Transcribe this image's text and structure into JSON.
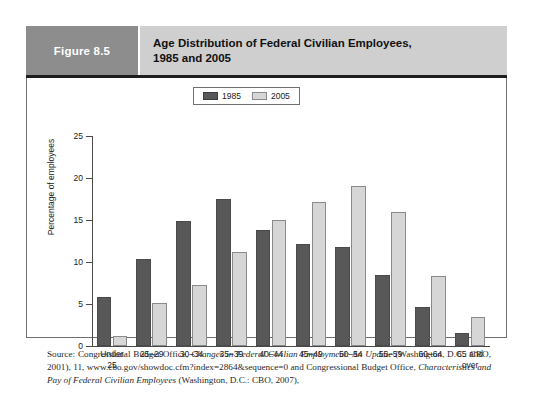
{
  "figure": {
    "number_label": "Figure 8.5",
    "title_line1": "Age Distribution of Federal Civilian Employees,",
    "title_line2": "1985 and 2005"
  },
  "colors": {
    "series_1985": "#585858",
    "series_2005": "#d6d6d6",
    "header_band": "#cfcfcf",
    "figure_number_block": "#8d8d8d",
    "axis": "#4a4a4a"
  },
  "source": {
    "prefix": "Source: Congressional Budget Office, ",
    "title_1": "Changes in Federal Civilian Employment: An Update",
    "middle": " (Washington, D.C.: CBO, 2001), 11, www.cbo.gov/showdoc.cfm?index=2864&sequence=0 and Congressional Budget Office, ",
    "title_2": "Characteristics and Pay of Federal Civilian Employees",
    "suffix": " (Washington, D.C.: CBO, 2007),"
  },
  "chart_data": {
    "type": "bar",
    "title": "Age Distribution of Federal Civilian Employees, 1985 and 2005",
    "xlabel": "",
    "ylabel": "Percentage of employees",
    "ylim": [
      0,
      25
    ],
    "yticks": [
      0,
      5,
      10,
      15,
      20,
      25
    ],
    "ytick_labels": [
      "0",
      "5",
      "10",
      "15",
      "20",
      "25"
    ],
    "grid": false,
    "legend_position": "top-center",
    "categories": [
      "Under 25",
      "25–29",
      "30–34",
      "35–39",
      "40–44",
      "45–49",
      "50–54",
      "55–59",
      "60–64",
      "65 and over"
    ],
    "category_lines": [
      [
        "Under",
        "25"
      ],
      [
        "25–29"
      ],
      [
        "30–34"
      ],
      [
        "35–39"
      ],
      [
        "40–44"
      ],
      [
        "45–49"
      ],
      [
        "50–54"
      ],
      [
        "55–59"
      ],
      [
        "60–64"
      ],
      [
        "65 and",
        "over"
      ]
    ],
    "series": [
      {
        "name": "1985",
        "color": "#585858",
        "values": [
          5.8,
          10.4,
          14.9,
          17.5,
          13.8,
          12.2,
          11.8,
          8.4,
          4.6,
          1.5
        ]
      },
      {
        "name": "2005",
        "color": "#d6d6d6",
        "values": [
          1.2,
          5.1,
          7.3,
          11.2,
          15.0,
          17.2,
          19.0,
          16.0,
          8.3,
          3.4
        ]
      }
    ]
  }
}
